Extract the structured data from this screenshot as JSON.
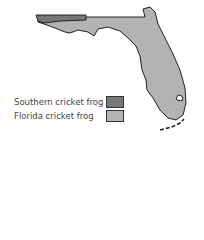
{
  "map": {
    "region": "Florida",
    "legend": [
      {
        "label": "Southern cricket frog",
        "color": "#777777"
      },
      {
        "label": "Florida cricket frog",
        "color": "#b3b3b3"
      }
    ]
  }
}
